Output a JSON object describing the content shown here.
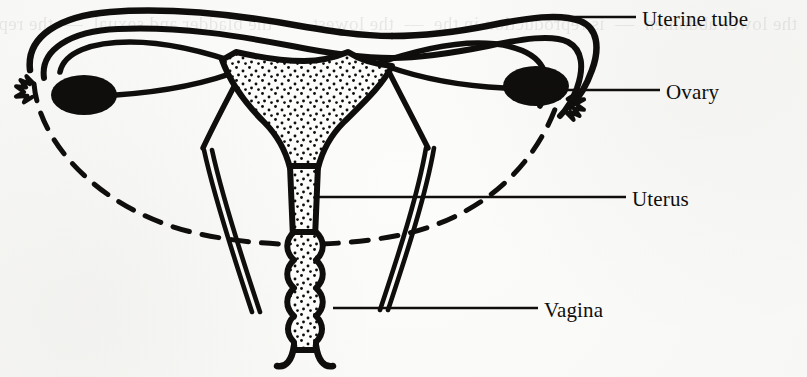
{
  "figure": {
    "kind": "anatomical-line-diagram",
    "background_color": "#fcfcfa",
    "ink_color": "#100e0c",
    "bleed_through_text": "the lower abdomen  —  is reproduction in the  —  the lowest  —  the bladder and sexual  —  the reproductive system"
  },
  "labels": [
    {
      "id": "uterine-tube",
      "text": "Uterine tube",
      "x": 642,
      "y": 9,
      "leader": {
        "x1": 555,
        "y1": 17,
        "x2": 636,
        "y2": 17
      }
    },
    {
      "id": "ovary",
      "text": "Ovary",
      "x": 666,
      "y": 82,
      "leader": {
        "x1": 520,
        "y1": 90,
        "x2": 660,
        "y2": 90
      }
    },
    {
      "id": "uterus",
      "text": "Uterus",
      "x": 632,
      "y": 189,
      "leader": {
        "x1": 318,
        "y1": 197,
        "x2": 626,
        "y2": 197
      }
    },
    {
      "id": "vagina",
      "text": "Vagina",
      "x": 544,
      "y": 300,
      "leader": {
        "x1": 333,
        "y1": 308,
        "x2": 538,
        "y2": 308
      }
    }
  ],
  "structures": [
    {
      "id": "uterine-tube-left",
      "name": "Left uterine tube (fallopian tube)",
      "fill": "none"
    },
    {
      "id": "uterine-tube-right",
      "name": "Right uterine tube (fallopian tube)",
      "fill": "none"
    },
    {
      "id": "fimbriae-left",
      "name": "Left fimbriae",
      "fill": "none"
    },
    {
      "id": "fimbriae-right",
      "name": "Right fimbriae",
      "fill": "none"
    },
    {
      "id": "ovary-left",
      "name": "Left ovary",
      "fill": "#100e0c"
    },
    {
      "id": "ovary-right",
      "name": "Right ovary",
      "fill": "#100e0c"
    },
    {
      "id": "ovarian-ligament-left",
      "name": "Left ovarian ligament",
      "fill": "none"
    },
    {
      "id": "ovarian-ligament-right",
      "name": "Right ovarian ligament",
      "fill": "none"
    },
    {
      "id": "uterus-body",
      "name": "Body of uterus with stippled cavity",
      "fill": "stipple"
    },
    {
      "id": "cervix",
      "name": "Cervix",
      "fill": "stipple"
    },
    {
      "id": "vagina-canal",
      "name": "Vagina (scalloped canal, stippled lumen)",
      "fill": "stipple"
    },
    {
      "id": "vaginal-orifice",
      "name": "Vaginal orifice",
      "fill": "none"
    },
    {
      "id": "broad-ligament-arc",
      "name": "Broad ligament outline (dashed arc)",
      "fill": "none"
    }
  ]
}
